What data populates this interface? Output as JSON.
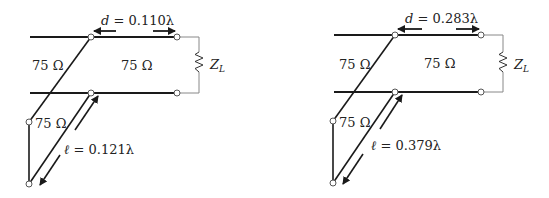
{
  "diagrams": [
    {
      "id": "left",
      "d_label": "d = 0.110λ",
      "d_var": "d",
      "d_value": " = 0.110λ",
      "l_var": "ℓ",
      "l_value": " = 0.121λ",
      "z_main": "75 Ω",
      "z_left": "75 Ω",
      "z_stub": "75 Ω",
      "load_label": "Z",
      "load_sub": "L"
    },
    {
      "id": "right",
      "d_label": "d = 0.283λ",
      "d_var": "d",
      "d_value": " = 0.283λ",
      "l_var": "ℓ",
      "l_value": " = 0.379λ",
      "z_main": "75 Ω",
      "z_left": "75 Ω",
      "z_stub": "75 Ω",
      "load_label": "Z",
      "load_sub": "L"
    }
  ],
  "colors": {
    "line": "#1a1a1a",
    "thin": "#888888",
    "node_fill": "#ffffff"
  }
}
